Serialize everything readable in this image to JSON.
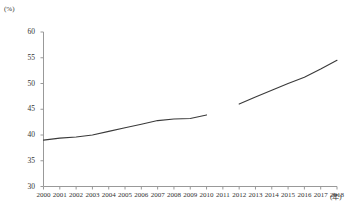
{
  "chart_data": {
    "type": "line",
    "title": "",
    "xlabel": "(年)",
    "ylabel": "(%)",
    "ylim": [
      30,
      60
    ],
    "xlim": [
      2000,
      2018
    ],
    "yticks": [
      30,
      35,
      40,
      45,
      50,
      55,
      60
    ],
    "ytick_labels": [
      "30",
      "35",
      "40",
      "45",
      "50",
      "55",
      "60"
    ],
    "xticks": [
      2000,
      2001,
      2002,
      2003,
      2004,
      2005,
      2006,
      2007,
      2008,
      2009,
      2010,
      2011,
      2012,
      2013,
      2014,
      2015,
      2016,
      2017,
      2018
    ],
    "xtick_labels": [
      "2000",
      "2001",
      "2002",
      "2003",
      "2004",
      "2005",
      "2006",
      "2007",
      "2008",
      "2009",
      "2010",
      "2011",
      "2012",
      "2013",
      "2014",
      "2015",
      "2016",
      "2017",
      "2018"
    ],
    "grid": false,
    "legend": false,
    "legend_position": "none",
    "line_color": "#3a3a3a",
    "axis_color": "#999999",
    "series": [
      {
        "name": "segment-1",
        "x": [
          2000,
          2001,
          2002,
          2003,
          2004,
          2005,
          2006,
          2007,
          2008,
          2009,
          2010
        ],
        "values": [
          39.0,
          39.4,
          39.6,
          40.0,
          40.7,
          41.4,
          42.1,
          42.8,
          43.1,
          43.2,
          43.9
        ]
      },
      {
        "name": "segment-2",
        "x": [
          2012,
          2013,
          2014,
          2015,
          2016,
          2017,
          2018
        ],
        "values": [
          46.0,
          47.4,
          48.7,
          50.0,
          51.2,
          52.8,
          54.5
        ]
      }
    ]
  },
  "axes": {
    "y_unit": "(%)",
    "x_unit": "(年)"
  }
}
